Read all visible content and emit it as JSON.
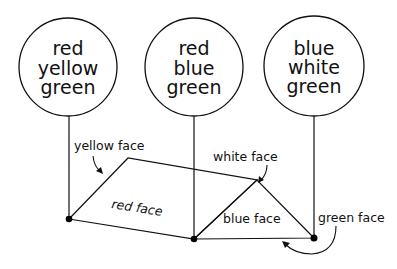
{
  "diagram": {
    "vertex_labels": [
      {
        "lines": [
          "red",
          "yellow",
          "green"
        ]
      },
      {
        "lines": [
          "red",
          "blue",
          "green"
        ]
      },
      {
        "lines": [
          "blue",
          "white",
          "green"
        ]
      }
    ],
    "face_labels": {
      "yellow": "yellow face",
      "white": "white face",
      "red": "red face",
      "blue": "blue face",
      "green": "green face"
    }
  }
}
